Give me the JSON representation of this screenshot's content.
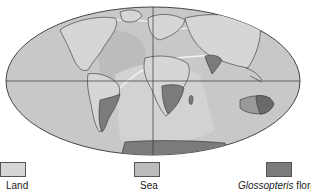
{
  "map": {
    "projection": "Mollweide world map",
    "features": [
      {
        "name": "South America Glossopteris region",
        "class": "glossopteris"
      },
      {
        "name": "Southern Africa Glossopteris region",
        "class": "glossopteris"
      },
      {
        "name": "India Glossopteris region",
        "class": "glossopteris"
      },
      {
        "name": "Australia Glossopteris region",
        "class": "glossopteris"
      },
      {
        "name": "Antarctica Glossopteris region",
        "class": "glossopteris"
      }
    ],
    "colors": {
      "land": "#d6d6d6",
      "sea": "#bcbcbc",
      "glossopteris": "#7b7b7b",
      "outline": "#333333",
      "paleo_shoreline": "#f2f2f2"
    }
  },
  "legend": {
    "items": [
      {
        "label": "Land",
        "italic_part": "",
        "color": "#d6d6d6"
      },
      {
        "label": "Sea",
        "italic_part": "",
        "color": "#bcbcbc"
      },
      {
        "label": " flora",
        "italic_part": "Glossopteris",
        "color": "#7b7b7b"
      }
    ]
  }
}
